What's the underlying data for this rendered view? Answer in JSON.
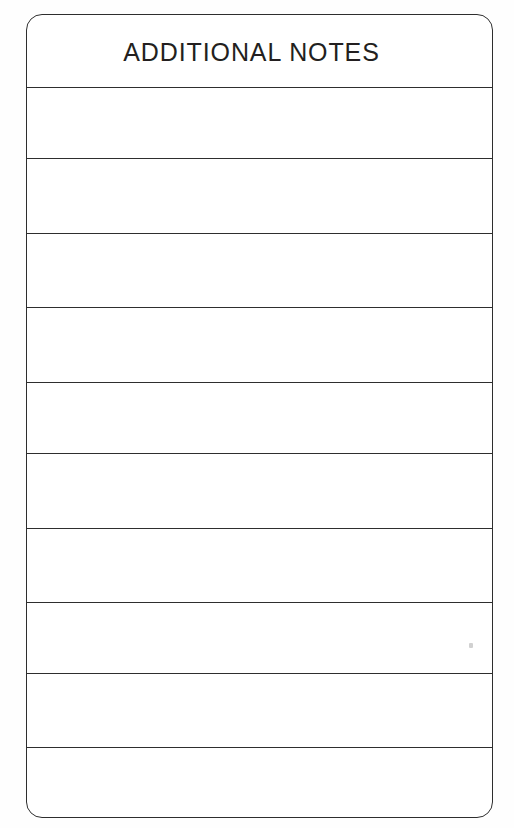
{
  "document": {
    "type": "form-section",
    "background_color": "#fefefe",
    "ink_color": "#2e2e2e",
    "text_color": "#231f20"
  },
  "card": {
    "name": "additional-notes-card",
    "corner_radius_px": 16,
    "border_color": "#2e2e2e"
  },
  "header": {
    "title": "ADDITIONAL NOTES"
  },
  "notes_rows": [
    {
      "index": 1,
      "value": "",
      "placeholder": ""
    },
    {
      "index": 2,
      "value": "",
      "placeholder": ""
    },
    {
      "index": 3,
      "value": "",
      "placeholder": ""
    },
    {
      "index": 4,
      "value": "",
      "placeholder": ""
    },
    {
      "index": 5,
      "value": "",
      "placeholder": ""
    },
    {
      "index": 6,
      "value": "",
      "placeholder": ""
    },
    {
      "index": 7,
      "value": "",
      "placeholder": ""
    },
    {
      "index": 8,
      "value": "",
      "placeholder": ""
    },
    {
      "index": 9,
      "value": "",
      "placeholder": ""
    },
    {
      "index": 10,
      "value": "",
      "placeholder": ""
    }
  ],
  "row_geometry": {
    "line_y_positions": [
      87,
      158,
      233,
      307,
      382,
      453,
      528,
      602,
      673,
      747,
      818
    ],
    "header_top_y": 14,
    "header_bottom_y": 87,
    "card_left_x": 26,
    "card_right_x": 493
  },
  "artifacts": {
    "speck_label": "scan-speck"
  }
}
